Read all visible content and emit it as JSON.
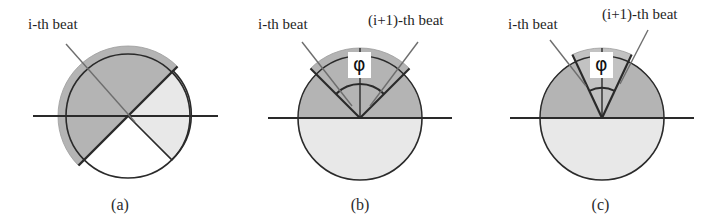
{
  "figure": {
    "panels": [
      {
        "id": "a",
        "caption": "(a)",
        "labels": [
          {
            "name": "i-th-beat",
            "text": "i-th beat"
          }
        ],
        "angle_symbol": null
      },
      {
        "id": "b",
        "caption": "(b)",
        "labels": [
          {
            "name": "i-th-beat",
            "text": "i-th beat"
          },
          {
            "name": "i-plus-1-th-beat",
            "text": "(i+1)-th beat"
          }
        ],
        "angle_symbol": "φ"
      },
      {
        "id": "c",
        "caption": "(c)",
        "labels": [
          {
            "name": "i-th-beat",
            "text": "i-th beat"
          },
          {
            "name": "i-plus-1-th-beat",
            "text": "(i+1)-th beat"
          }
        ],
        "angle_symbol": "φ"
      }
    ]
  },
  "colors": {
    "dark_sector": "#b4b4b4",
    "light_sector": "#e8e8e8",
    "outline": "#2a2a2a",
    "leader_line": "#6e6e6e",
    "background": "#ffffff",
    "text": "#1f1f1f"
  },
  "geometry": {
    "panel_a": {
      "center_x": 128,
      "center_y": 116,
      "radius": 62,
      "diameter_line_angle_deg": 135,
      "dark_sector_from_deg": 45,
      "dark_sector_to_deg": 225,
      "baseline_x1": 33,
      "baseline_x2": 218
    },
    "panel_b": {
      "center_x": 120,
      "center_y": 118,
      "radius": 62,
      "beat_i_angle_deg": 135,
      "beat_i1_angle_deg": 45,
      "phi_arc_radius": 34,
      "baseline_x1": 28,
      "baseline_x2": 212
    },
    "panel_c": {
      "center_x": 122,
      "center_y": 118,
      "radius": 62,
      "beat_i_angle_deg": 115,
      "beat_i1_angle_deg": 65,
      "phi_arc_radius": 30,
      "baseline_x1": 30,
      "baseline_x2": 214
    }
  }
}
